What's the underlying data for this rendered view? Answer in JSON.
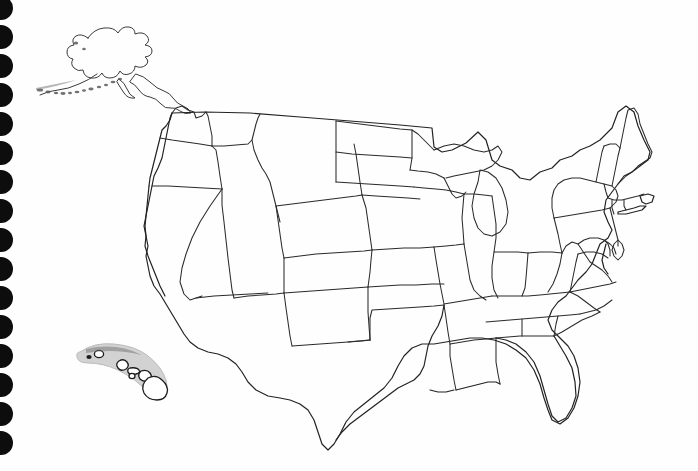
{
  "document": {
    "title": "Blank United States Outline Map",
    "type": "scanned-worksheet",
    "media": "spiral-bound notebook page",
    "background_color": "#ffffff",
    "line_color": "#2b2b2b",
    "labels_present": false,
    "caption": ""
  },
  "binding": {
    "name": "spiral-binding-holes",
    "edge": "left",
    "hole_count": 16,
    "hole_color": "#0d0d0d",
    "hole_diameter_px": 24,
    "spacing_px": 29,
    "first_hole_center_y": 8
  },
  "map": {
    "name": "united-states-outline-map",
    "projection_hint": "albers-equal-area-conic",
    "state_borders_visible": true,
    "state_names_visible": false,
    "regions": [
      {
        "name": "alaska",
        "label": "",
        "inset": true,
        "position": "top-left"
      },
      {
        "name": "hawaii",
        "label": "",
        "inset": true,
        "position": "lower-left"
      },
      {
        "name": "contiguous-united-states",
        "label": "",
        "inset": false,
        "position": "center-right"
      }
    ],
    "states": [
      "Washington",
      "Oregon",
      "California",
      "Nevada",
      "Idaho",
      "Montana",
      "Wyoming",
      "Utah",
      "Arizona",
      "Colorado",
      "New Mexico",
      "North Dakota",
      "South Dakota",
      "Nebraska",
      "Kansas",
      "Oklahoma",
      "Texas",
      "Minnesota",
      "Iowa",
      "Missouri",
      "Arkansas",
      "Louisiana",
      "Wisconsin",
      "Illinois",
      "Michigan",
      "Indiana",
      "Ohio",
      "Kentucky",
      "Tennessee",
      "Mississippi",
      "Alabama",
      "Georgia",
      "Florida",
      "South Carolina",
      "North Carolina",
      "Virginia",
      "West Virginia",
      "Maryland",
      "Delaware",
      "Pennsylvania",
      "New Jersey",
      "New York",
      "Connecticut",
      "Rhode Island",
      "Massachusetts",
      "Vermont",
      "New Hampshire",
      "Maine",
      "Alaska",
      "Hawaii"
    ],
    "state_count": 50
  },
  "hawaii_inset": {
    "name": "hawaii-island-chain",
    "band_color": "#cfcfcf",
    "islands": [
      "Niihau",
      "Kauai",
      "Oahu",
      "Molokai",
      "Lanai",
      "Maui",
      "Hawaii"
    ],
    "island_count": 7
  },
  "alaska_inset": {
    "name": "alaska-outline",
    "aleutian_chain_visible": true
  }
}
